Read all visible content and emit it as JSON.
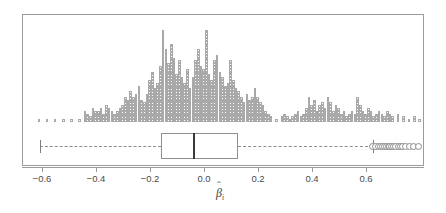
{
  "figure": {
    "type": "histogram-with-boxplot",
    "background_color": "#ffffff",
    "frame_color": "#9b9b9b",
    "cell_color": "#a9a9a9",
    "median_color": "#3a3a3a"
  },
  "axis": {
    "label_main": "β",
    "label_hat": "ˆ",
    "label_sub": "i",
    "tick_labels": [
      "−0.6",
      "−0.4",
      "−0.2",
      "0.0",
      "0.2",
      "0.4",
      "0.6"
    ],
    "tick_values": [
      -0.6,
      -0.4,
      -0.2,
      0.0,
      0.2,
      0.4,
      0.6
    ],
    "xlim": [
      -0.69,
      0.8
    ]
  },
  "chart_data": {
    "type": "histogram",
    "title": "",
    "xlabel": "β̂_i",
    "ylabel": "",
    "grid": false,
    "legend": "none",
    "xlim": [
      -0.69,
      0.8
    ],
    "bin_width": 0.01,
    "note": "stacked-square dot histogram; each unit = one observation cell",
    "bin_centers": [
      -0.615,
      -0.585,
      -0.555,
      -0.525,
      -0.495,
      -0.465,
      -0.445,
      -0.435,
      -0.425,
      -0.415,
      -0.405,
      -0.395,
      -0.385,
      -0.375,
      -0.365,
      -0.355,
      -0.345,
      -0.335,
      -0.325,
      -0.315,
      -0.305,
      -0.295,
      -0.285,
      -0.275,
      -0.265,
      -0.255,
      -0.245,
      -0.235,
      -0.225,
      -0.215,
      -0.205,
      -0.195,
      -0.185,
      -0.175,
      -0.165,
      -0.155,
      -0.145,
      -0.135,
      -0.125,
      -0.115,
      -0.105,
      -0.095,
      -0.085,
      -0.075,
      -0.065,
      -0.055,
      -0.045,
      -0.035,
      -0.025,
      -0.015,
      -0.005,
      0.005,
      0.015,
      0.025,
      0.035,
      0.045,
      0.055,
      0.065,
      0.075,
      0.085,
      0.095,
      0.105,
      0.115,
      0.125,
      0.135,
      0.145,
      0.155,
      0.165,
      0.175,
      0.185,
      0.195,
      0.205,
      0.215,
      0.225,
      0.235,
      0.245,
      0.265,
      0.285,
      0.295,
      0.305,
      0.315,
      0.325,
      0.335,
      0.345,
      0.355,
      0.365,
      0.375,
      0.385,
      0.395,
      0.405,
      0.415,
      0.425,
      0.435,
      0.445,
      0.455,
      0.465,
      0.475,
      0.485,
      0.495,
      0.505,
      0.515,
      0.525,
      0.535,
      0.545,
      0.555,
      0.565,
      0.575,
      0.585,
      0.595,
      0.605,
      0.615,
      0.625,
      0.635,
      0.645,
      0.655,
      0.665,
      0.675,
      0.685,
      0.695,
      0.715,
      0.735,
      0.755,
      0.775,
      0.795
    ],
    "counts": [
      1,
      1,
      1,
      1,
      1,
      1,
      4,
      3,
      2,
      5,
      4,
      4,
      5,
      3,
      6,
      5,
      4,
      3,
      4,
      5,
      6,
      9,
      8,
      11,
      9,
      10,
      13,
      8,
      7,
      10,
      15,
      18,
      12,
      14,
      20,
      33,
      26,
      21,
      28,
      23,
      17,
      22,
      16,
      14,
      19,
      12,
      16,
      22,
      26,
      20,
      19,
      33,
      17,
      15,
      22,
      24,
      18,
      16,
      13,
      14,
      22,
      15,
      12,
      11,
      9,
      7,
      10,
      8,
      9,
      12,
      9,
      7,
      6,
      4,
      3,
      2,
      1,
      2,
      3,
      2,
      1,
      2,
      3,
      4,
      2,
      3,
      5,
      9,
      6,
      8,
      4,
      6,
      7,
      5,
      9,
      7,
      4,
      6,
      5,
      3,
      4,
      2,
      3,
      4,
      3,
      9,
      6,
      4,
      3,
      5,
      4,
      2,
      3,
      4,
      3,
      2,
      4,
      3,
      2,
      3,
      2,
      1,
      2,
      1,
      1,
      1
    ]
  },
  "boxplot": {
    "orientation": "horizontal",
    "whisker_low": -0.611,
    "q1": -0.163,
    "median": -0.044,
    "q3": 0.122,
    "whisker_high": 0.622,
    "whisker_style": "dashed",
    "outliers": [
      0.622,
      0.632,
      0.641,
      0.65,
      0.658,
      0.664,
      0.671,
      0.678,
      0.685,
      0.692,
      0.699,
      0.707,
      0.715,
      0.724,
      0.733,
      0.744,
      0.757,
      0.772,
      0.79
    ]
  }
}
